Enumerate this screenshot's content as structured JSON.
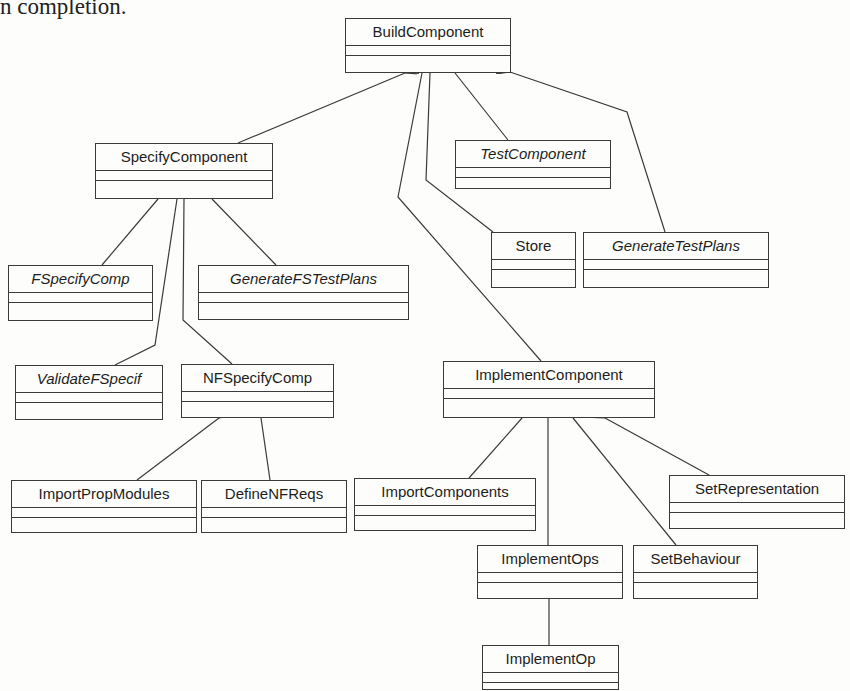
{
  "caption": "n completion.",
  "classes": {
    "build_component": {
      "name": "BuildComponent",
      "abstract": false
    },
    "specify_component": {
      "name": "SpecifyComponent",
      "abstract": false
    },
    "test_component": {
      "name": "TestComponent",
      "abstract": true
    },
    "store": {
      "name": "Store",
      "abstract": false
    },
    "generate_test_plans": {
      "name": "GenerateTestPlans",
      "abstract": true
    },
    "fspecify_comp": {
      "name": "FSpecifyComp",
      "abstract": true
    },
    "generate_fs_test_plans": {
      "name": "GenerateFSTestPlans",
      "abstract": true
    },
    "validate_fspecif": {
      "name": "ValidateFSpecif",
      "abstract": true
    },
    "nfspecify_comp": {
      "name": "NFSpecifyComp",
      "abstract": false
    },
    "implement_component": {
      "name": "ImplementComponent",
      "abstract": false
    },
    "import_prop_modules": {
      "name": "ImportPropModules",
      "abstract": false
    },
    "define_nf_reqs": {
      "name": "DefineNFReqs",
      "abstract": false
    },
    "import_components": {
      "name": "ImportComponents",
      "abstract": false
    },
    "set_representation": {
      "name": "SetRepresentation",
      "abstract": false
    },
    "implement_ops": {
      "name": "ImplementOps",
      "abstract": false
    },
    "set_behaviour": {
      "name": "SetBehaviour",
      "abstract": false
    },
    "implement_op": {
      "name": "ImplementOp",
      "abstract": false
    }
  },
  "aggregations": [
    {
      "whole": "BuildComponent",
      "part": "SpecifyComponent"
    },
    {
      "whole": "BuildComponent",
      "part": "ImplementComponent"
    },
    {
      "whole": "BuildComponent",
      "part": "Store"
    },
    {
      "whole": "BuildComponent",
      "part": "TestComponent"
    },
    {
      "whole": "BuildComponent",
      "part": "GenerateTestPlans"
    },
    {
      "whole": "SpecifyComponent",
      "part": "FSpecifyComp"
    },
    {
      "whole": "SpecifyComponent",
      "part": "ValidateFSpecif"
    },
    {
      "whole": "SpecifyComponent",
      "part": "NFSpecifyComp"
    },
    {
      "whole": "SpecifyComponent",
      "part": "GenerateFSTestPlans"
    },
    {
      "whole": "NFSpecifyComp",
      "part": "ImportPropModules"
    },
    {
      "whole": "NFSpecifyComp",
      "part": "DefineNFReqs"
    },
    {
      "whole": "ImplementComponent",
      "part": "ImportComponents"
    },
    {
      "whole": "ImplementComponent",
      "part": "ImplementOps"
    },
    {
      "whole": "ImplementComponent",
      "part": "SetBehaviour"
    },
    {
      "whole": "ImplementComponent",
      "part": "SetRepresentation"
    },
    {
      "whole": "ImplementOps",
      "part": "ImplementOp"
    }
  ],
  "colors": {
    "line": "#3a3a3a",
    "background": "#fdfdfb",
    "text": "#1d1d1d"
  }
}
